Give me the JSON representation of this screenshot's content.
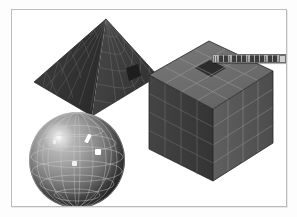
{
  "app": {
    "title": "3D Viewport",
    "canvas_background": "#ffffff",
    "page_background": "#fdfdfd",
    "frame_border_color": "#b9bcc0"
  },
  "viewport": {
    "label": "3D modelling viewport",
    "objects": [
      {
        "id": "pyramid",
        "name": "Pyramid",
        "kind": "square-pyramid",
        "shading": "flat-shaded-wireframe",
        "base_color": "#3a3a3a",
        "wire_color": "#6f6f6f",
        "subdivisions": 6,
        "selected_face_color": "#1d1d1d",
        "has_selected_face": true
      },
      {
        "id": "sphere",
        "name": "Sphere",
        "kind": "uv-sphere",
        "shading": "smooth-shaded-wireframe",
        "base_color": "#7b7b7b",
        "wire_color": "#c9c9c9",
        "meridians": 12,
        "parallels": 7,
        "highlight_color": "#ffffff",
        "has_specular_highlight": true
      },
      {
        "id": "cube",
        "name": "Cube",
        "kind": "subdivided-cube",
        "shading": "flat-shaded-wireframe",
        "top_face_color": "#6e6e6e",
        "left_face_color": "#3d3d3d",
        "right_face_color": "#585858",
        "wire_color": "#a8a8a8",
        "subdivisions": 4,
        "selected_face_color": "#2a2a2a",
        "has_selected_face": true
      }
    ]
  },
  "toolbar": {
    "name": "floating-tool-palette",
    "grip_label": "Drag handle",
    "close_label": "Close",
    "buttons": [
      {
        "id": "select",
        "icon": "arrow-cursor-icon",
        "label": "Select"
      },
      {
        "id": "move",
        "icon": "move-icon",
        "label": "Move"
      },
      {
        "id": "rotate",
        "icon": "rotate-icon",
        "label": "Rotate"
      },
      {
        "id": "scale",
        "icon": "scale-icon",
        "label": "Scale"
      },
      {
        "id": "vertex",
        "icon": "vertex-icon",
        "label": "Vertex"
      },
      {
        "id": "edge",
        "icon": "edge-icon",
        "label": "Edge"
      },
      {
        "id": "face",
        "icon": "face-icon",
        "label": "Face"
      },
      {
        "id": "extrude",
        "icon": "extrude-icon",
        "label": "Extrude"
      },
      {
        "id": "subdivide",
        "icon": "subdivide-icon",
        "label": "Subdivide"
      },
      {
        "id": "render",
        "icon": "render-icon",
        "label": "Render"
      }
    ]
  }
}
